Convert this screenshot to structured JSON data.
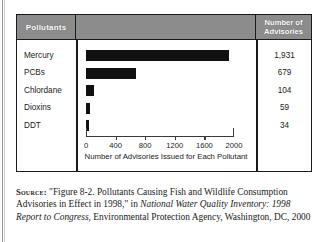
{
  "figure": {
    "header": {
      "category_column": "Pollutants",
      "value_column_line1": "Number of",
      "value_column_line2": "Advisories"
    },
    "colors": {
      "header_background": "#8c8c8c",
      "header_text": "#ffffff",
      "bar": "#111111",
      "border": "#1a1a1a",
      "axis": "#3a3a3a"
    }
  },
  "chart_data": {
    "type": "bar",
    "orientation": "horizontal",
    "categories": [
      "Mercury",
      "PCBs",
      "Chlordane",
      "Dioxins",
      "DDT"
    ],
    "values": [
      1931,
      679,
      104,
      59,
      34
    ],
    "value_labels": [
      "1,931",
      "679",
      "104",
      "59",
      "34"
    ],
    "title": "",
    "xlabel": "Number of Advisories Issued for Each Pollutant",
    "ylabel": "Pollutants",
    "xlim": [
      0,
      2000
    ],
    "xticks": [
      0,
      400,
      800,
      1200,
      1600,
      2000
    ],
    "xticklabels": [
      "0",
      "400",
      "800",
      "1200",
      "1600",
      "2000"
    ],
    "grid": false,
    "legend": false
  },
  "source": {
    "label": "Source:",
    "line1": "\"Figure 8-2. Pollutants Causing Fish and Wildlife",
    "line2_pre": "Consumption Advisories in Effect in 1998,\" in ",
    "line2_italic": "National Water",
    "line3_italic": "Quality Inventory: 1998 Report to Congress",
    "line3_post": ", Environmental",
    "line4": "Protection Agency, Washington, DC, 2000"
  }
}
